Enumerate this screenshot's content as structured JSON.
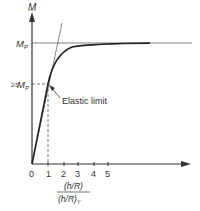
{
  "diagram": {
    "y_axis": {
      "label": "M"
    },
    "x_axis": {
      "ticks": [
        "0",
        "1",
        "2",
        "3",
        "4",
        "5"
      ],
      "label_numerator": "(h/R)",
      "label_denominator": "(h/R)",
      "label_denominator_sub": "Y"
    },
    "y_levels": {
      "mp_label": "M",
      "mp_sub": "P",
      "two_thirds_frac": "2/3",
      "two_thirds_label": "M",
      "two_thirds_sub": "P"
    },
    "annotation": {
      "text": "Elastic limit"
    },
    "colors": {
      "line": "#333333",
      "curve": "#222222",
      "thin": "#555555"
    }
  }
}
